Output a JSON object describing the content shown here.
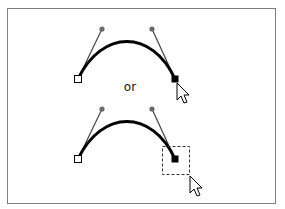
{
  "diagram": {
    "separator_label": "or",
    "colors": {
      "frame": "#7d7d7d",
      "curve": "#000000",
      "handle_line": "#444444",
      "handle_point": "#6a6a6a",
      "selected_anchor": "#000000",
      "unselected_anchor_fill": "#ffffff"
    },
    "panels": [
      {
        "name": "click-anchor",
        "interaction": "click on end anchor point",
        "marquee": false
      },
      {
        "name": "marquee-select-anchor",
        "interaction": "drag selection marquee around end anchor point",
        "marquee": true
      }
    ]
  }
}
